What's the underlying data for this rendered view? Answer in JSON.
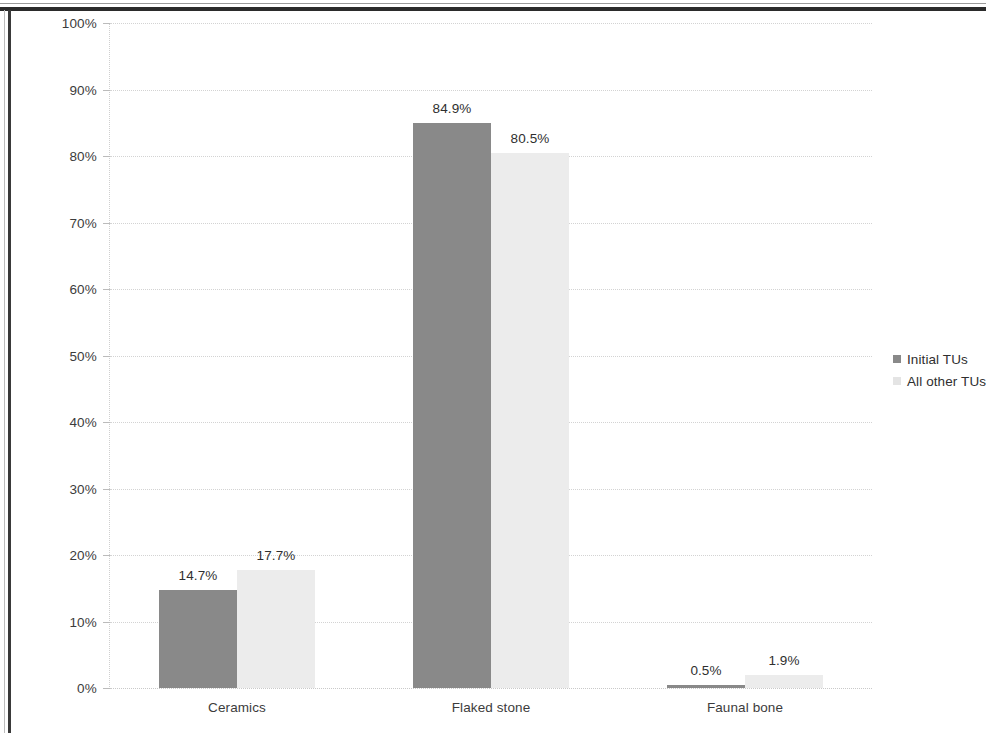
{
  "chart_data": {
    "type": "bar",
    "title": "",
    "xlabel": "",
    "ylabel": "",
    "ylim": [
      0,
      100
    ],
    "grid": true,
    "legend_position": "right",
    "categories": [
      "Ceramics",
      "Flaked stone",
      "Faunal bone"
    ],
    "y_ticks": [
      "0%",
      "10%",
      "20%",
      "30%",
      "40%",
      "50%",
      "60%",
      "70%",
      "80%",
      "90%",
      "100%"
    ],
    "y_tick_values": [
      0,
      10,
      20,
      30,
      40,
      50,
      60,
      70,
      80,
      90,
      100
    ],
    "series": [
      {
        "name": "Initial TUs",
        "color": "#898989",
        "values": [
          14.7,
          84.9,
          0.5
        ],
        "data_labels": [
          "14.7%",
          "84.9%",
          "0.5%"
        ]
      },
      {
        "name": "All other TUs",
        "color": "#ececec",
        "values": [
          17.7,
          80.5,
          1.9
        ],
        "data_labels": [
          "17.7%",
          "80.5%",
          "1.9%"
        ]
      }
    ]
  },
  "legend": {
    "items": [
      {
        "label": "Initial TUs"
      },
      {
        "label": "All other TUs"
      }
    ]
  }
}
